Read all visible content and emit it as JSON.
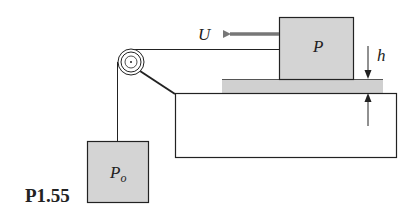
{
  "figure": {
    "id_label": "P1.55"
  },
  "labels": {
    "velocity": "U",
    "block_top": "P",
    "block_hanging_main": "P",
    "block_hanging_sub": "o",
    "gap": "h"
  },
  "colors": {
    "block_fill": "#d4d4d4",
    "film_fill": "#d0d0d0",
    "line": "#222222",
    "arrow": "#777777",
    "background": "#ffffff"
  }
}
